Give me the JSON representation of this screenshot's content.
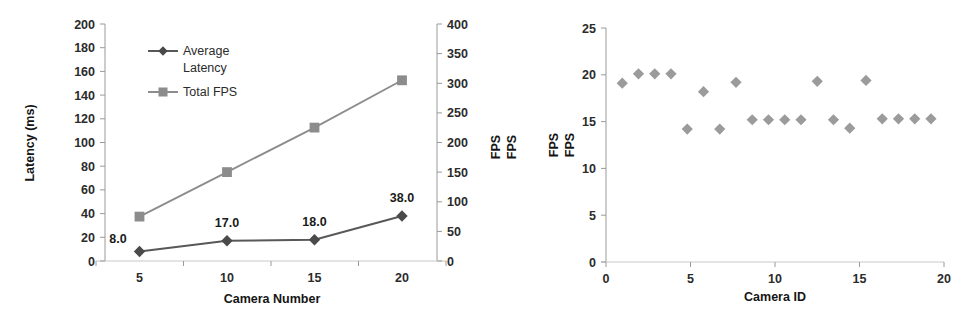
{
  "figure": {
    "background": "#ffffff",
    "series_colors": {
      "average_latency": "#585858",
      "total_fps": "#8c8c8c",
      "scatter_fps": "#9b9b9b",
      "axis": "#9a9a9a",
      "text": "#2b2b2b"
    }
  },
  "chart_data": [
    {
      "type": "line",
      "title": "",
      "xlabel": "Camera Number",
      "ylabel": "Latency (ms)",
      "y2label": "FPS",
      "y2label_duplicate": "FPS",
      "x": [
        5,
        10,
        15,
        20
      ],
      "xtick_labels": [
        "5",
        "10",
        "15",
        "20"
      ],
      "xlim": [
        2.5,
        22.5
      ],
      "ylim": [
        0,
        200
      ],
      "ytick_labels": [
        "0",
        "20",
        "40",
        "60",
        "80",
        "100",
        "120",
        "140",
        "160",
        "180",
        "200"
      ],
      "ytick_values": [
        0,
        20,
        40,
        60,
        80,
        100,
        120,
        140,
        160,
        180,
        200
      ],
      "y2lim": [
        0,
        400
      ],
      "y2tick_labels": [
        "0",
        "50",
        "100",
        "150",
        "200",
        "250",
        "300",
        "350",
        "400"
      ],
      "y2tick_values": [
        0,
        50,
        100,
        150,
        200,
        250,
        300,
        350,
        400
      ],
      "grid": false,
      "legend_position": "upper-left-inside",
      "series": [
        {
          "name": "Average Latency",
          "axis": "primary",
          "marker": "diamond",
          "color": "#585858",
          "values": [
            8.0,
            17.0,
            18.0,
            38.0
          ],
          "data_labels": [
            "8.0",
            "17.0",
            "18.0",
            "38.0"
          ]
        },
        {
          "name": "Total FPS",
          "axis": "secondary",
          "marker": "square",
          "color": "#8c8c8c",
          "values": [
            75,
            150,
            225,
            305
          ],
          "data_labels": []
        }
      ]
    },
    {
      "type": "scatter",
      "title": "",
      "xlabel": "Camera ID",
      "ylabel": "FPS",
      "ylabel_duplicate": "FPS",
      "xlim": [
        0,
        20.8
      ],
      "ylim": [
        0,
        25
      ],
      "xtick_labels": [
        "0",
        "5",
        "10",
        "15",
        "20"
      ],
      "xtick_values": [
        0,
        5,
        10,
        15,
        20
      ],
      "ytick_labels": [
        "0",
        "5",
        "10",
        "15",
        "20",
        "25"
      ],
      "ytick_values": [
        0,
        5,
        10,
        15,
        20,
        25
      ],
      "grid": false,
      "marker": "diamond",
      "color": "#9b9b9b",
      "x": [
        1,
        2,
        3,
        4,
        5,
        6,
        7,
        8,
        9,
        10,
        11,
        12,
        13,
        14,
        15,
        16,
        17,
        18,
        19,
        20
      ],
      "y": [
        19.1,
        20.1,
        20.1,
        20.1,
        14.2,
        18.2,
        14.2,
        19.2,
        15.2,
        15.2,
        15.2,
        15.2,
        19.3,
        15.2,
        14.3,
        19.4,
        15.3,
        15.3,
        15.3,
        15.3
      ]
    }
  ]
}
